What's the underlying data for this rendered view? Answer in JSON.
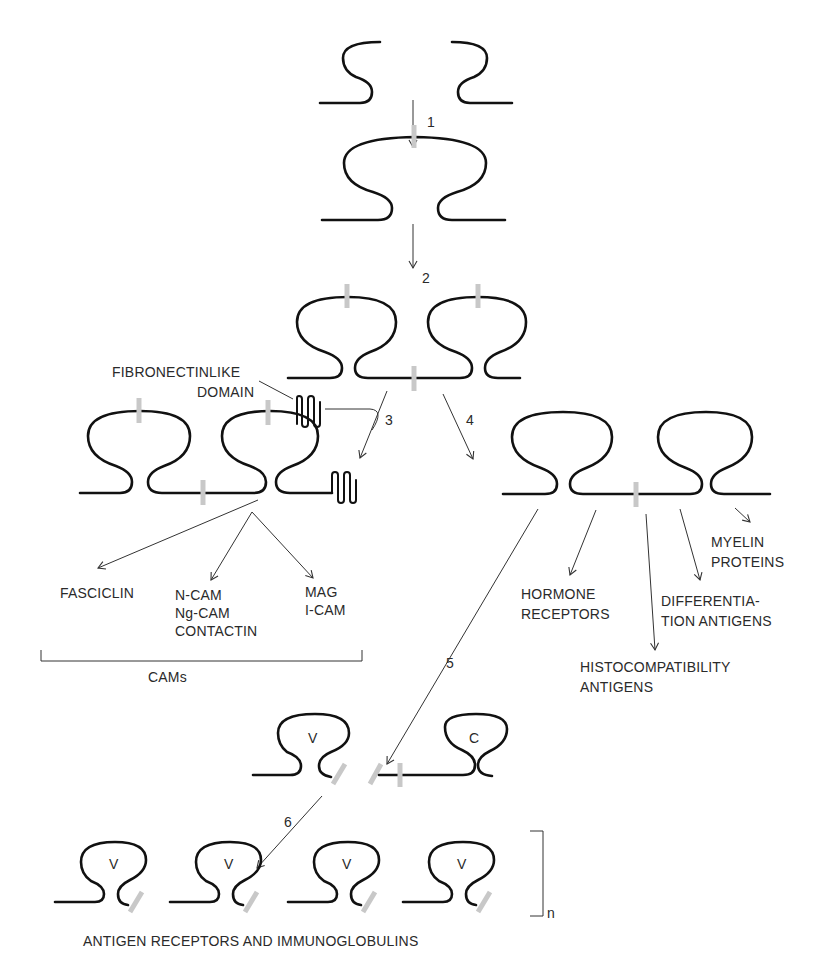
{
  "steps": {
    "s1": "1",
    "s2": "2",
    "s3": "3",
    "s4": "4",
    "s5": "5",
    "s6": "6"
  },
  "labels": {
    "fibronectin_line1": "FIBRONECTINLIKE",
    "fibronectin_line2": "DOMAIN",
    "fasciclin": "FASCICLIN",
    "ncam_1": "N-CAM",
    "ncam_2": "Ng-CAM",
    "ncam_3": "CONTACTIN",
    "mag_1": "MAG",
    "mag_2": "I-CAM",
    "cams": "CAMs",
    "hormone_1": "HORMONE",
    "hormone_2": "RECEPTORS",
    "histo_1": "HISTOCOMPATIBILITY",
    "histo_2": "ANTIGENS",
    "diff_1": "DIFFERENTIA-",
    "diff_2": "TION ANTIGENS",
    "myelin_1": "MYELIN",
    "myelin_2": "PROTEINS",
    "v_domain": "V",
    "c_domain": "C",
    "repeat_n": "n",
    "bottom_caption": "ANTIGEN RECEPTORS AND IMMUNOGLOBULINS"
  },
  "colors": {
    "domain_stroke": "#111111",
    "disulfide_bar": "#c8c8c8",
    "text": "#2a2a2a"
  }
}
